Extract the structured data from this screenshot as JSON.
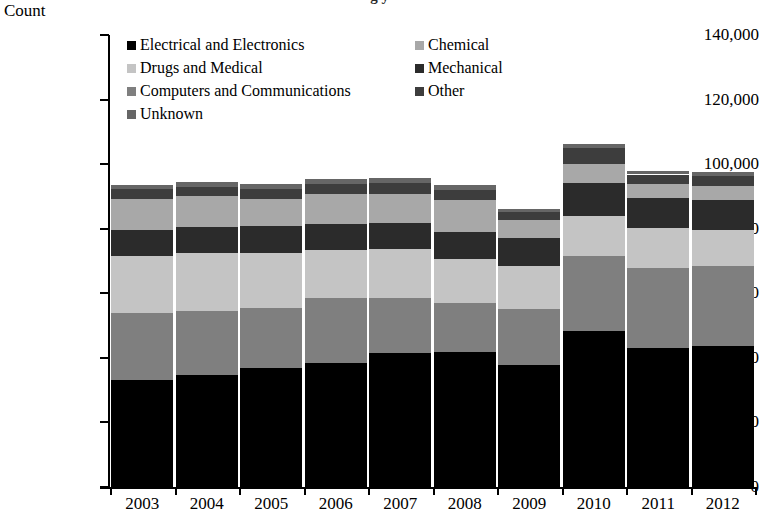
{
  "chart_data": {
    "type": "bar",
    "subtype": "stacked-bar",
    "title": "",
    "xlabel": "",
    "ylabel": "Count",
    "ylim": [
      0,
      140000
    ],
    "ytick_step": 20000,
    "grid": false,
    "legend_position": "inside-top-left",
    "categories": [
      "2003",
      "2004",
      "2005",
      "2006",
      "2007",
      "2008",
      "2009",
      "2010",
      "2011",
      "2012"
    ],
    "ytick_labels": [
      "0",
      "20,000",
      "40,000",
      "60,000",
      "80,000",
      "100,000",
      "120,000",
      "140,000"
    ],
    "ytick_values": [
      0,
      20000,
      40000,
      60000,
      80000,
      100000,
      120000,
      140000
    ],
    "series": [
      {
        "name": "Electrical and Electronics",
        "color": "#000000",
        "values": [
          33300,
          34700,
          37000,
          38400,
          41500,
          41800,
          37800,
          48400,
          43200,
          43800
        ]
      },
      {
        "name": "Computers and Communications",
        "color": "#7f7f7f",
        "values": [
          20600,
          19900,
          18300,
          20000,
          16900,
          15300,
          17400,
          23300,
          24600,
          24700
        ]
      },
      {
        "name": "Drugs and Medical",
        "color": "#c4c4c4",
        "values": [
          17800,
          17900,
          17100,
          14900,
          15400,
          13600,
          13200,
          12100,
          12500,
          11200
        ]
      },
      {
        "name": "Mechanical",
        "color": "#2b2b2b",
        "values": [
          7900,
          7900,
          8400,
          8100,
          7900,
          8300,
          8800,
          10300,
          9300,
          9200
        ]
      },
      {
        "name": "Chemical",
        "color": "#a8a8a8",
        "values": [
          9700,
          9600,
          8500,
          9400,
          9100,
          9900,
          5400,
          5800,
          4200,
          4400
        ]
      },
      {
        "name": "Other",
        "color": "#3d3d3d",
        "values": [
          3000,
          3000,
          3100,
          3100,
          3300,
          3200,
          2500,
          5200,
          3000,
          3100
        ]
      },
      {
        "name": "Unknown",
        "color": "#666666",
        "values": [
          1400,
          1400,
          1400,
          1400,
          1500,
          1500,
          1100,
          1200,
          1100,
          1100
        ]
      }
    ],
    "totals": [
      93700,
      94400,
      93800,
      95300,
      95600,
      93600,
      86200,
      106300,
      97900,
      97500
    ]
  },
  "legend": {
    "items": [
      {
        "label": "Electrical and Electronics",
        "color": "#000000",
        "swatch_name": "legend-swatch-electrical-and-electronics"
      },
      {
        "label": "Chemical",
        "color": "#a8a8a8",
        "swatch_name": "legend-swatch-chemical"
      },
      {
        "label": "Drugs and Medical",
        "color": "#c4c4c4",
        "swatch_name": "legend-swatch-drugs-and-medical"
      },
      {
        "label": "Mechanical",
        "color": "#2b2b2b",
        "swatch_name": "legend-swatch-mechanical"
      },
      {
        "label": "Computers and Communications",
        "color": "#7f7f7f",
        "swatch_name": "legend-swatch-computers-and-communications"
      },
      {
        "label": "Other",
        "color": "#3d3d3d",
        "swatch_name": "legend-swatch-other"
      },
      {
        "label": "Unknown",
        "color": "#666666",
        "swatch_name": "legend-swatch-unknown"
      }
    ]
  },
  "axis": {
    "y_title": "Count"
  },
  "title_clipped": "g y"
}
